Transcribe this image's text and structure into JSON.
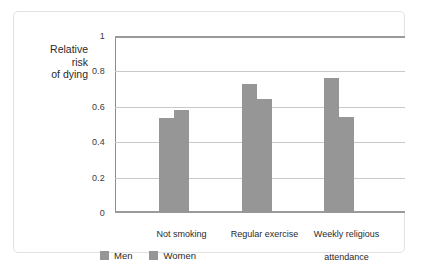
{
  "chart_data": {
    "type": "bar",
    "title": "",
    "xlabel": "",
    "ylabel": "Relative risk of dying",
    "ylabel_lines": [
      "Relative",
      "risk",
      "of dying"
    ],
    "categories": [
      "Not smoking",
      "Regular exercise",
      "Weekly religious attendance"
    ],
    "category_label_lines": [
      [
        "Not smoking"
      ],
      [
        "Regular exercise"
      ],
      [
        "Weekly religious",
        "attendance"
      ]
    ],
    "series": [
      {
        "name": "Men",
        "values": [
          0.545,
          0.735,
          0.77
        ]
      },
      {
        "name": "Women",
        "values": [
          0.59,
          0.65,
          0.55
        ]
      }
    ],
    "ylim": [
      0,
      1
    ],
    "yticks": [
      0,
      0.2,
      0.4,
      0.6,
      0.8,
      1
    ],
    "ytick_labels": [
      "0",
      "0.2",
      "0.4",
      "0.6",
      "0.8",
      "1"
    ],
    "grid": true,
    "legend_position": "bottom-left",
    "colors": {
      "men": "#969696",
      "women": "#969696",
      "gridline": "#c9c9c9",
      "axis": "#8d8d8d",
      "frame": "#e2e2e2",
      "text": "#2a2a2a",
      "background": "#ffffff"
    }
  }
}
